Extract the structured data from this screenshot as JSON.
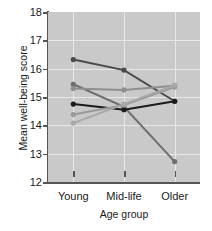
{
  "chart_data": {
    "type": "line",
    "title": "",
    "xlabel": "Age group",
    "ylabel": "Mean well-being score",
    "categories": [
      "Young",
      "Mid-life",
      "Older"
    ],
    "ylim": [
      12,
      18
    ],
    "yticks": [
      12,
      13,
      14,
      15,
      16,
      17,
      18
    ],
    "grid": true,
    "legend": "none",
    "series": [
      {
        "name": "series-1",
        "color": "#4a4a4a",
        "values": [
          16.32,
          15.95,
          14.85
        ]
      },
      {
        "name": "series-2",
        "color": "#6e6e6e",
        "values": [
          15.45,
          14.65,
          12.72
        ]
      },
      {
        "name": "series-3",
        "color": "#8e8e8e",
        "values": [
          15.3,
          15.25,
          15.4
        ]
      },
      {
        "name": "series-4",
        "color": "#1a1a1a",
        "values": [
          14.75,
          14.55,
          14.85
        ]
      },
      {
        "name": "series-5",
        "color": "#9a9a9a",
        "values": [
          14.38,
          14.72,
          15.35
        ]
      },
      {
        "name": "series-6",
        "color": "#a8a8a8",
        "values": [
          14.08,
          14.75,
          15.42
        ]
      }
    ]
  },
  "axes": {
    "ytick_labels": [
      "18",
      "17",
      "16",
      "15",
      "14",
      "13",
      "12"
    ],
    "xtick_labels": [
      "Young",
      "Mid-life",
      "Older"
    ],
    "y_axis_title": "Mean well-being score",
    "x_axis_title": "Age group"
  },
  "colors": {
    "plot_background": "#c9c9c9",
    "grid": "#e8e8e8",
    "axis": "#555555",
    "text": "#1a1a1a"
  }
}
